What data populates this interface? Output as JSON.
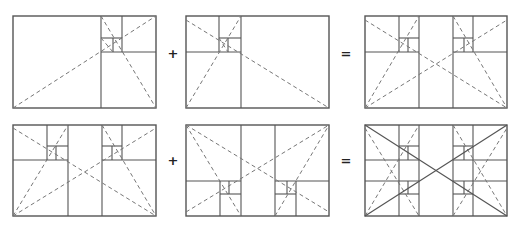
{
  "diagram": {
    "colors": {
      "line": "#555555",
      "dash": "#777777",
      "operator": "#222222",
      "background": "#ffffff"
    },
    "operators": [
      {
        "symbol": "+",
        "x": 173,
        "y": 53
      },
      {
        "symbol": "=",
        "x": 346,
        "y": 53
      },
      {
        "symbol": "+",
        "x": 173,
        "y": 160
      },
      {
        "symbol": "=",
        "x": 346,
        "y": 160
      }
    ],
    "panels": [
      {
        "id": "top-left",
        "name": "golden-spiral-right",
        "frame": [
          13,
          16,
          156,
          108
        ],
        "solid": [
          [
            101,
            16,
            101,
            108
          ],
          [
            101,
            52,
            156,
            52
          ],
          [
            122,
            16,
            122,
            52
          ],
          [
            101,
            38,
            122,
            38
          ],
          [
            113,
            38,
            113,
            52
          ]
        ],
        "dashed": [
          [
            13,
            108,
            156,
            16
          ],
          [
            101,
            16,
            156,
            108
          ],
          [
            101,
            38,
            113,
            52
          ]
        ],
        "diag": []
      },
      {
        "id": "top-middle",
        "name": "golden-spiral-left",
        "frame": [
          186,
          16,
          329,
          108
        ],
        "solid": [
          [
            241,
            16,
            241,
            108
          ],
          [
            186,
            52,
            241,
            52
          ],
          [
            219,
            16,
            219,
            52
          ],
          [
            219,
            38,
            241,
            38
          ],
          [
            228,
            38,
            228,
            52
          ]
        ],
        "dashed": [
          [
            186,
            20,
            329,
            108
          ],
          [
            186,
            108,
            241,
            16
          ],
          [
            219,
            38,
            228,
            52
          ]
        ],
        "diag": []
      },
      {
        "id": "top-right",
        "name": "combined-top",
        "frame": [
          365,
          16,
          507,
          108
        ],
        "solid": [
          [
            419,
            16,
            419,
            108
          ],
          [
            453,
            16,
            453,
            108
          ],
          [
            365,
            52,
            419,
            52
          ],
          [
            453,
            52,
            507,
            52
          ],
          [
            399,
            16,
            399,
            52
          ],
          [
            399,
            38,
            419,
            38
          ],
          [
            408,
            38,
            408,
            52
          ],
          [
            473,
            16,
            473,
            52
          ],
          [
            453,
            38,
            473,
            38
          ],
          [
            464,
            38,
            464,
            52
          ]
        ],
        "dashed": [
          [
            365,
            20,
            507,
            108
          ],
          [
            365,
            108,
            419,
            16
          ],
          [
            365,
            108,
            507,
            20
          ],
          [
            453,
            16,
            507,
            108
          ]
        ],
        "diag": []
      },
      {
        "id": "bottom-left",
        "name": "combined-top-copy",
        "frame": [
          13,
          125,
          156,
          216
        ],
        "solid": [
          [
            68,
            125,
            68,
            216
          ],
          [
            102,
            125,
            102,
            216
          ],
          [
            13,
            160,
            68,
            160
          ],
          [
            102,
            160,
            156,
            160
          ],
          [
            47,
            125,
            47,
            160
          ],
          [
            47,
            146,
            68,
            146
          ],
          [
            56,
            146,
            56,
            160
          ],
          [
            122,
            125,
            122,
            160
          ],
          [
            102,
            146,
            122,
            146
          ],
          [
            112,
            146,
            112,
            160
          ]
        ],
        "dashed": [
          [
            13,
            128,
            156,
            216
          ],
          [
            13,
            216,
            68,
            125
          ],
          [
            13,
            216,
            156,
            128
          ],
          [
            102,
            125,
            156,
            216
          ]
        ],
        "diag": []
      },
      {
        "id": "bottom-middle",
        "name": "combined-bottom-flipped",
        "frame": [
          186,
          125,
          329,
          216
        ],
        "solid": [
          [
            241,
            125,
            241,
            216
          ],
          [
            275,
            125,
            275,
            216
          ],
          [
            186,
            181,
            241,
            181
          ],
          [
            275,
            181,
            329,
            181
          ],
          [
            220,
            181,
            220,
            216
          ],
          [
            220,
            194,
            241,
            194
          ],
          [
            229,
            181,
            229,
            194
          ],
          [
            296,
            181,
            296,
            216
          ],
          [
            275,
            194,
            296,
            194
          ],
          [
            287,
            181,
            287,
            194
          ]
        ],
        "dashed": [
          [
            186,
            125,
            329,
            212
          ],
          [
            186,
            212,
            329,
            125
          ],
          [
            186,
            125,
            241,
            216
          ],
          [
            275,
            216,
            329,
            125
          ]
        ],
        "diag": []
      },
      {
        "id": "bottom-right",
        "name": "final-composite-grid",
        "frame": [
          365,
          125,
          507,
          216
        ],
        "solid": [
          [
            419,
            125,
            419,
            216
          ],
          [
            453,
            125,
            453,
            216
          ],
          [
            365,
            160,
            419,
            160
          ],
          [
            453,
            160,
            507,
            160
          ],
          [
            365,
            181,
            419,
            181
          ],
          [
            453,
            181,
            507,
            181
          ],
          [
            399,
            125,
            399,
            216
          ],
          [
            473,
            125,
            473,
            216
          ],
          [
            399,
            146,
            419,
            146
          ],
          [
            399,
            194,
            419,
            194
          ],
          [
            453,
            146,
            473,
            146
          ],
          [
            453,
            194,
            473,
            194
          ],
          [
            408,
            146,
            408,
            160
          ],
          [
            408,
            181,
            408,
            194
          ],
          [
            464,
            146,
            464,
            160
          ],
          [
            464,
            181,
            464,
            194
          ]
        ],
        "dashed": [
          [
            365,
            128,
            419,
            216
          ],
          [
            365,
            216,
            419,
            125
          ],
          [
            453,
            125,
            507,
            216
          ],
          [
            453,
            216,
            507,
            128
          ]
        ],
        "diag": [
          [
            365,
            125,
            507,
            216
          ],
          [
            365,
            216,
            507,
            125
          ]
        ]
      }
    ]
  }
}
